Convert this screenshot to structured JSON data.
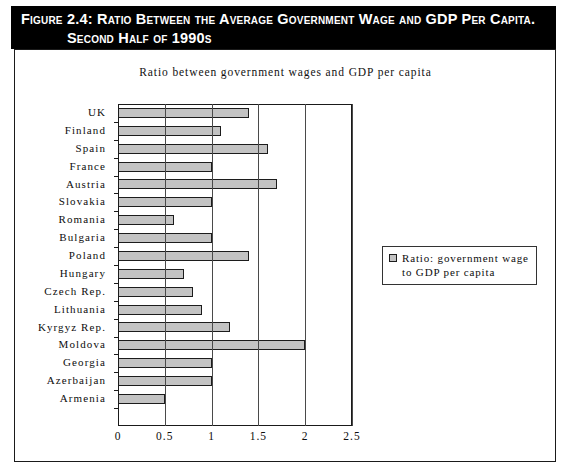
{
  "figure": {
    "caption_line1": "Figure 2.4:  Ratio Between the Average Government Wage and GDP Per Capita.",
    "caption_line2": "Second Half of 1990s"
  },
  "legend": {
    "entries": [
      {
        "label_line1": "Ratio: government wage",
        "label_line2": "to GDP per capita",
        "color": "#c3c3c3"
      }
    ]
  },
  "axis": {
    "x_ticks": [
      "0",
      "0.5",
      "1",
      "1.5",
      "2",
      "2.5"
    ],
    "x_tick_values": [
      0,
      0.5,
      1,
      1.5,
      2,
      2.5
    ]
  },
  "colors": {
    "bar_fill": "#c3c3c3",
    "bar_border": "#1c1c1c",
    "banner_bg": "#000000",
    "banner_text": "#ffffff",
    "frame": "#1a1a1a"
  },
  "chart_data": {
    "type": "bar",
    "orientation": "horizontal",
    "title": "Ratio between government wages and GDP per capita",
    "xlabel": "",
    "ylabel": "",
    "xlim": [
      0,
      2.5
    ],
    "grid": true,
    "legend_position": "right",
    "categories": [
      "UK",
      "Finland",
      "Spain",
      "France",
      "Austria",
      "Slovakia",
      "Romania",
      "Bulgaria",
      "Poland",
      "Hungary",
      "Czech Rep.",
      "Lithuania",
      "Kyrgyz Rep.",
      "Moldova",
      "Georgia",
      "Azerbaijan",
      "Armenia"
    ],
    "series": [
      {
        "name": "Ratio: government wage to GDP per capita",
        "values": [
          1.4,
          1.1,
          1.6,
          1.0,
          1.7,
          1.0,
          0.6,
          1.0,
          1.4,
          0.7,
          0.8,
          0.9,
          1.2,
          2.0,
          1.0,
          1.0,
          0.5
        ]
      }
    ]
  }
}
